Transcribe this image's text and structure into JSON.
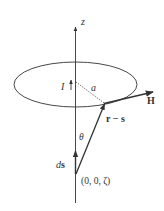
{
  "diagram": {
    "type": "physics-vector-diagram",
    "labels": {
      "axis": "z",
      "current": "I",
      "radius": "a",
      "field": "H",
      "separation": "r − s",
      "angle": "θ",
      "element": "ds",
      "element_d": "d",
      "element_s": "s",
      "point": "(0, 0, ζ)"
    },
    "colors": {
      "line": "#333333",
      "thick": "#3a3a3a"
    }
  }
}
